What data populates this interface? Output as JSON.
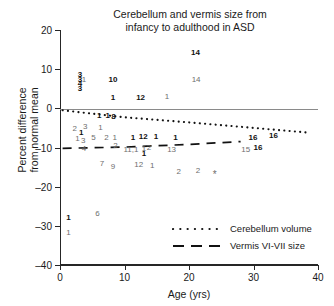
{
  "chart_data": {
    "type": "scatter",
    "title": "Cerebellum and vermis size from infancy to adulthood in ASD",
    "title_lines": [
      "Cerebellum and vermis size from",
      "infancy to adulthood in ASD"
    ],
    "xlabel": "Age (yrs)",
    "ylabel": "Percent difference from normal mean",
    "ylabel_lines": [
      "Percent difference",
      "from normal mean"
    ],
    "xlim": [
      0,
      40
    ],
    "ylim": [
      -40,
      20
    ],
    "xticks": [
      0,
      10,
      20,
      30,
      40
    ],
    "yticks": [
      20,
      10,
      0,
      -10,
      -20,
      -30,
      -40
    ],
    "xtick_labels": [
      "0",
      "10",
      "20",
      "30",
      "40"
    ],
    "ytick_labels": [
      "20",
      "10",
      "0",
      "-10",
      "-20",
      "-30",
      "-40"
    ],
    "grid": false,
    "zero_reference_line": 0,
    "legend_position": "lower-right-inside",
    "legend": [
      {
        "key": "dotted",
        "label": "Cerebellum volume",
        "color": "#111111"
      },
      {
        "key": "dashed",
        "label": "Vermis VI-VII size",
        "color": "#111111"
      }
    ],
    "series": [
      {
        "name": "Cerebellum volume",
        "style": "bold-numeric-label",
        "color": "#111111",
        "marker_is_text": true,
        "points": [
          {
            "x": 3.1,
            "y": 8.4,
            "label": "3"
          },
          {
            "x": 3.1,
            "y": 7.2,
            "label": "3"
          },
          {
            "x": 3.1,
            "y": 6.2,
            "label": "4"
          },
          {
            "x": 3.1,
            "y": 5.0,
            "label": "3"
          },
          {
            "x": 8.2,
            "y": 7.3,
            "label": "10"
          },
          {
            "x": 21.0,
            "y": 14.2,
            "label": "14"
          },
          {
            "x": 8.2,
            "y": 2.6,
            "label": "1"
          },
          {
            "x": 12.5,
            "y": 2.6,
            "label": "12"
          },
          {
            "x": 6.1,
            "y": -2.0,
            "label": "1"
          },
          {
            "x": 7.4,
            "y": -2.0,
            "label": "1"
          },
          {
            "x": 8.3,
            "y": -2.1,
            "label": "8"
          },
          {
            "x": 3.3,
            "y": -6.2,
            "label": "1"
          },
          {
            "x": 11.3,
            "y": -7.6,
            "label": "1"
          },
          {
            "x": 12.9,
            "y": -7.3,
            "label": "12"
          },
          {
            "x": 14.9,
            "y": -7.4,
            "label": "1"
          },
          {
            "x": 17.9,
            "y": -7.6,
            "label": "1"
          },
          {
            "x": 29.9,
            "y": -7.5,
            "label": "16"
          },
          {
            "x": 33.1,
            "y": -7.0,
            "label": "16"
          },
          {
            "x": 30.7,
            "y": -10.2,
            "label": "16"
          },
          {
            "x": 13.0,
            "y": -11.6,
            "label": "1"
          },
          {
            "x": 1.3,
            "y": -28.0,
            "label": "1"
          }
        ]
      },
      {
        "name": "Vermis VI-VII size",
        "style": "gray-numeric-label",
        "color": "#6e6e6e",
        "marker_is_text": true,
        "points": [
          {
            "x": 3.7,
            "y": 7.3,
            "label": "1"
          },
          {
            "x": 21.1,
            "y": 7.2,
            "label": "14"
          },
          {
            "x": 16.6,
            "y": 2.8,
            "label": "1"
          },
          {
            "x": 2.3,
            "y": -5.3,
            "label": "2"
          },
          {
            "x": 3.9,
            "y": -4.8,
            "label": "3"
          },
          {
            "x": 6.3,
            "y": -5.1,
            "label": "1"
          },
          {
            "x": 2.7,
            "y": -7.7,
            "label": "1"
          },
          {
            "x": 3.6,
            "y": -8.4,
            "label": "3"
          },
          {
            "x": 5.2,
            "y": -7.5,
            "label": "5"
          },
          {
            "x": 7.2,
            "y": -7.6,
            "label": "2"
          },
          {
            "x": 8.5,
            "y": -7.6,
            "label": "1"
          },
          {
            "x": 3.7,
            "y": -10.3,
            "label": "4"
          },
          {
            "x": 8.6,
            "y": -9.6,
            "label": "2"
          },
          {
            "x": 11.0,
            "y": -10.6,
            "label": "11,1"
          },
          {
            "x": 13.0,
            "y": -10.3,
            "label": "1"
          },
          {
            "x": 13.8,
            "y": -10.1,
            "label": "2"
          },
          {
            "x": 17.3,
            "y": -10.7,
            "label": "13"
          },
          {
            "x": 28.8,
            "y": -10.5,
            "label": "15"
          },
          {
            "x": 6.5,
            "y": -14.1,
            "label": "7"
          },
          {
            "x": 8.2,
            "y": -14.9,
            "label": "9"
          },
          {
            "x": 12.2,
            "y": -14.4,
            "label": "12"
          },
          {
            "x": 14.3,
            "y": -14.6,
            "label": "1"
          },
          {
            "x": 18.4,
            "y": -16.3,
            "label": "2"
          },
          {
            "x": 21.4,
            "y": -16.0,
            "label": "2"
          },
          {
            "x": 24.0,
            "y": -17.0,
            "label": "*"
          },
          {
            "x": 5.8,
            "y": -27.0,
            "label": "6"
          },
          {
            "x": 1.3,
            "y": -31.8,
            "label": "1"
          }
        ]
      }
    ],
    "trend_lines": [
      {
        "name": "Cerebellum volume",
        "style": "dotted",
        "color": "#111111",
        "points": [
          [
            0.4,
            -0.5
          ],
          [
            10.0,
            -2.3
          ],
          [
            20.0,
            -3.6
          ],
          [
            30.0,
            -5.0
          ],
          [
            38.5,
            -6.2
          ]
        ]
      },
      {
        "name": "Vermis VI-VII size",
        "style": "dashed",
        "color": "#111111",
        "points": [
          [
            0.4,
            -10.2
          ],
          [
            10.0,
            -9.9
          ],
          [
            20.0,
            -9.2
          ],
          [
            28.0,
            -8.5
          ]
        ]
      }
    ]
  }
}
